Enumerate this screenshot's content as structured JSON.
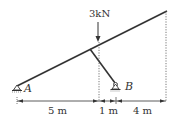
{
  "load": {
    "label": "3kN"
  },
  "supports": {
    "a_label": "A",
    "b_label": "B"
  },
  "dimensions": {
    "d1": "5 m",
    "d2": "1 m",
    "d3": "4 m"
  },
  "colors": {
    "stroke": "#333333",
    "dotted": "#555555",
    "background": "#ffffff"
  }
}
